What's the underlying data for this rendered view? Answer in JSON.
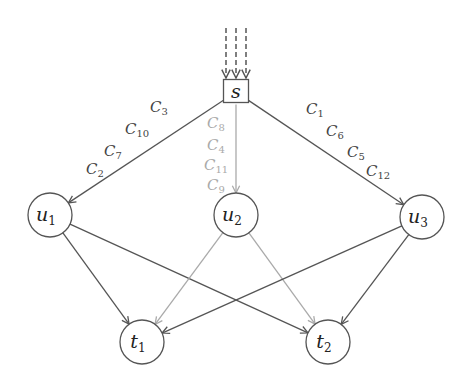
{
  "diagram": {
    "type": "directed-graph",
    "colors": {
      "dark_edge": "#555555",
      "light_edge": "#aaaaaa",
      "node_stroke": "#555555",
      "dark_label": "#444444",
      "light_label": "#aaaaaa"
    },
    "source_arrows": {
      "count": 3,
      "style": "dashed",
      "x": [
        226,
        236,
        246
      ],
      "y_start": 28,
      "y_end": 78
    },
    "nodes": [
      {
        "id": "s",
        "shape": "square",
        "label": "s",
        "sub": "",
        "x": 236,
        "y": 92,
        "size": 25
      },
      {
        "id": "u1",
        "shape": "circle",
        "label": "u",
        "sub": "1",
        "x": 50,
        "y": 215,
        "r": 22
      },
      {
        "id": "u2",
        "shape": "circle",
        "label": "u",
        "sub": "2",
        "x": 236,
        "y": 215,
        "r": 22
      },
      {
        "id": "u3",
        "shape": "circle",
        "label": "u",
        "sub": "3",
        "x": 422,
        "y": 217,
        "r": 22
      },
      {
        "id": "t1",
        "shape": "circle",
        "label": "t",
        "sub": "1",
        "x": 142,
        "y": 342,
        "r": 22
      },
      {
        "id": "t2",
        "shape": "circle",
        "label": "t",
        "sub": "2",
        "x": 328,
        "y": 342,
        "r": 22
      }
    ],
    "edges": [
      {
        "from": "s",
        "to": "u1",
        "tone": "dark"
      },
      {
        "from": "s",
        "to": "u2",
        "tone": "light"
      },
      {
        "from": "s",
        "to": "u3",
        "tone": "dark"
      },
      {
        "from": "u1",
        "to": "t1",
        "tone": "dark"
      },
      {
        "from": "u1",
        "to": "t2",
        "tone": "dark"
      },
      {
        "from": "u2",
        "to": "t1",
        "tone": "light"
      },
      {
        "from": "u2",
        "to": "t2",
        "tone": "light"
      },
      {
        "from": "u3",
        "to": "t1",
        "tone": "dark"
      },
      {
        "from": "u3",
        "to": "t2",
        "tone": "dark"
      }
    ],
    "edge_labels": {
      "s_u1": [
        {
          "base": "C",
          "sub": "3",
          "x": 150,
          "y": 112
        },
        {
          "base": "C",
          "sub": "10",
          "x": 125,
          "y": 134
        },
        {
          "base": "C",
          "sub": "7",
          "x": 104,
          "y": 156
        },
        {
          "base": "C",
          "sub": "2",
          "x": 86,
          "y": 174
        }
      ],
      "s_u2": [
        {
          "base": "C",
          "sub": "8",
          "x": 207,
          "y": 128
        },
        {
          "base": "C",
          "sub": "4",
          "x": 207,
          "y": 150
        },
        {
          "base": "C",
          "sub": "11",
          "x": 204,
          "y": 170
        },
        {
          "base": "C",
          "sub": "9",
          "x": 207,
          "y": 190
        }
      ],
      "s_u3": [
        {
          "base": "C",
          "sub": "1",
          "x": 306,
          "y": 114
        },
        {
          "base": "C",
          "sub": "6",
          "x": 326,
          "y": 136
        },
        {
          "base": "C",
          "sub": "5",
          "x": 347,
          "y": 157
        },
        {
          "base": "C",
          "sub": "12",
          "x": 366,
          "y": 176
        }
      ]
    }
  }
}
